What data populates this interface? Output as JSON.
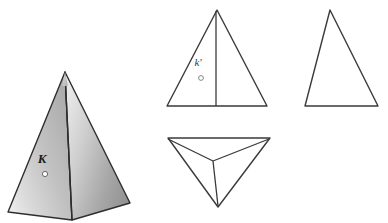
{
  "figure": {
    "background_color": "#ffffff",
    "line_color": "#333333",
    "labels": {
      "pictorial_point": "K",
      "front_view_point": "k'"
    },
    "views": [
      {
        "id": "pictorial",
        "name": "shaded-pyramid-pictorial-view",
        "description": "Shaded three-dimensional square pyramid",
        "label": "K",
        "point_marker": "open-circle"
      },
      {
        "id": "front-view",
        "name": "front-view-triangle",
        "description": "Front orthographic view: isosceles triangle with vertical centre line",
        "label": "k'",
        "point_marker": "open-circle"
      },
      {
        "id": "side-view",
        "name": "side-view-triangle",
        "description": "Side orthographic view: plain triangle",
        "label": "",
        "point_marker": "none"
      },
      {
        "id": "bottom-view",
        "name": "bottom-view-triangle",
        "description": "Bottom orthographic view: inverted triangle with Y shaped internal edges",
        "label": "",
        "point_marker": "none"
      }
    ],
    "geometry": {
      "pyramid": {
        "apex": [
          65,
          72
        ],
        "base_left": [
          8,
          212
        ],
        "base_front": [
          72,
          220
        ],
        "base_right": [
          130,
          203
        ],
        "front_edge_top": [
          65,
          72
        ],
        "left_face_fill": "#b9b9b9",
        "right_face_fill": "#9e9e9e"
      },
      "front_triangle": {
        "apex": [
          217,
          10
        ],
        "base_left": [
          167,
          106
        ],
        "base_right": [
          267,
          106
        ],
        "centre_line_x": 216
      },
      "side_triangle": {
        "apex": [
          330,
          10
        ],
        "base_left": [
          305,
          106
        ],
        "base_right": [
          378,
          106
        ]
      },
      "bottom_triangle": {
        "top_left": [
          168,
          138
        ],
        "top_right": [
          270,
          138
        ],
        "bottom": [
          218,
          207
        ],
        "centroid": [
          213,
          161
        ]
      },
      "k_label_pos": [
        42,
        158
      ],
      "k_point_pos": [
        45,
        171
      ],
      "kprime_label_pos": [
        198,
        62
      ],
      "kprime_point_pos": [
        201,
        76
      ]
    }
  }
}
